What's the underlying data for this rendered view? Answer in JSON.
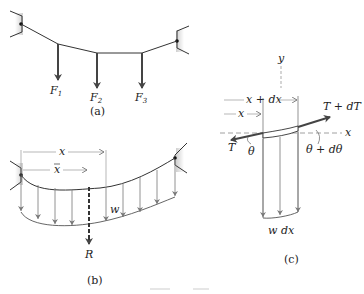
{
  "figure_a": {
    "caption": "(a)",
    "loads": [
      {
        "symbol": "F",
        "subscript": "1"
      },
      {
        "symbol": "F",
        "subscript": "2"
      },
      {
        "symbol": "F",
        "subscript": "3"
      }
    ]
  },
  "figure_b": {
    "caption": "(b)",
    "labels": {
      "x": "x",
      "x_bar": "x",
      "w": "w",
      "R": "R"
    }
  },
  "figure_c": {
    "caption": "(c)",
    "labels": {
      "y_axis": "y",
      "x_axis": "x",
      "x": "x",
      "x_plus_dx": "x + dx",
      "T": "T",
      "T_plus_dT": "T + dT",
      "theta": "θ",
      "theta_plus_dtheta": "θ + dθ",
      "w_dx": "w dx"
    }
  },
  "colors": {
    "line": "#333333",
    "arrow_heavy": "#444444",
    "load_light": "#777777",
    "dashed": "#888888",
    "support_shade": "#d8d8d8"
  }
}
